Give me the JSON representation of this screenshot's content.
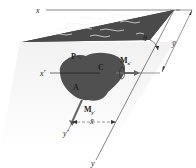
{
  "figure": {
    "type": "inclined-plane-submerged-area",
    "labels": {
      "x_axis": "x",
      "x_prime_axis": "x′",
      "y_axis": "y",
      "y_prime_axis": "y′",
      "angle": "θ",
      "y_bar": "ȳ",
      "x_bar": "x̄",
      "point_p": "P",
      "point_c": "C",
      "area": "A",
      "moment_x_prime": "Mx′",
      "moment_y_prime": "My′",
      "moment_symbol": "M",
      "moment_x_sub": "x′",
      "moment_y_sub": "y′"
    },
    "colors": {
      "fluid_surface": "#4a4a4a",
      "area_fill": "#505050",
      "plane_fill": "#eeeeee",
      "line": "#333333",
      "wave": "#f2f2f2"
    }
  }
}
